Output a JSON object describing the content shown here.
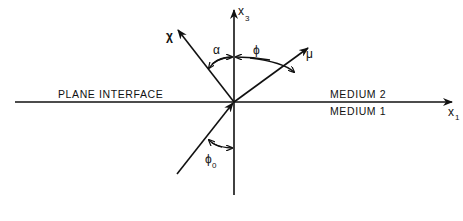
{
  "diagram": {
    "labels": {
      "interface": "PLANE INTERFACE",
      "medium_upper": "MEDIUM 2",
      "medium_lower": "MEDIUM 1",
      "axis_horizontal": "x",
      "axis_horizontal_sub": "1",
      "axis_vertical": "x",
      "axis_vertical_sub": "3",
      "vector_chi": "χ",
      "vector_mu": "μ",
      "angle_alpha": "α",
      "angle_phi": "ϕ",
      "angle_phi0": "ϕ",
      "angle_phi0_sub": "0"
    },
    "elements": [
      {
        "id": "x1-axis",
        "type": "arrow",
        "from": "left",
        "to": "right",
        "label": "x1"
      },
      {
        "id": "x3-axis",
        "type": "arrow",
        "from": "bottom",
        "to": "top",
        "label": "x3"
      },
      {
        "id": "incident-ray",
        "type": "arrow",
        "from": "medium 1",
        "to": "origin"
      },
      {
        "id": "chi-vector",
        "type": "arrow",
        "from": "origin",
        "to": "upper-left",
        "label": "χ"
      },
      {
        "id": "mu-vector",
        "type": "arrow",
        "from": "origin",
        "to": "upper-right",
        "label": "μ"
      },
      {
        "id": "alpha-angle",
        "type": "angle-arc",
        "between": [
          "χ",
          "x3"
        ],
        "label": "α"
      },
      {
        "id": "phi-angle",
        "type": "angle-arc",
        "between": [
          "x3",
          "μ"
        ],
        "label": "ϕ"
      },
      {
        "id": "phi0-angle",
        "type": "angle-arc",
        "between": [
          "incident-ray",
          "-x3"
        ],
        "label": "ϕ0"
      }
    ]
  }
}
